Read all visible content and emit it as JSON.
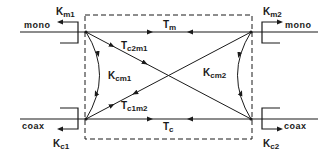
{
  "diagram": {
    "title": "",
    "colors": {
      "stroke": "#1a1a1a",
      "background": "#ffffff"
    },
    "ports": {
      "mono_left": "mono",
      "mono_right": "mono",
      "coax_left": "coax",
      "coax_right": "coax"
    },
    "coupling_labels": {
      "km1": {
        "main": "K",
        "sub": "m1"
      },
      "km2": {
        "main": "K",
        "sub": "m2"
      },
      "kc1": {
        "main": "K",
        "sub": "c1"
      },
      "kc2": {
        "main": "K",
        "sub": "c2"
      }
    },
    "transfer_labels": {
      "tm": {
        "main": "T",
        "sub": "m"
      },
      "tc": {
        "main": "T",
        "sub": "c"
      },
      "tc2m1": {
        "main": "T",
        "sub": "c2m1"
      },
      "tc1m2": {
        "main": "T",
        "sub": "c1m2"
      },
      "kcm1": {
        "main": "K",
        "sub": "cm1"
      },
      "kcm2": {
        "main": "K",
        "sub": "cm2"
      }
    }
  }
}
